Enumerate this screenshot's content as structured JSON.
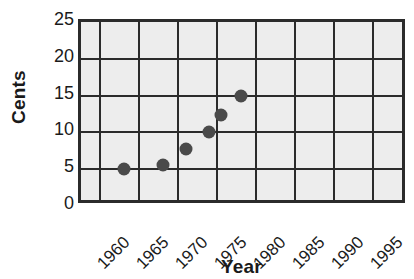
{
  "chart_data": {
    "type": "scatter",
    "title": "",
    "xlabel": "Year",
    "ylabel": "Cents",
    "xlim": [
      1957.5,
      1999.5
    ],
    "ylim": [
      0,
      25
    ],
    "xticks": [
      "1960",
      "1965",
      "1970",
      "1975",
      "1980",
      "1985",
      "1990",
      "1995"
    ],
    "xtick_values": [
      1960,
      1965,
      1970,
      1975,
      1980,
      1985,
      1990,
      1995
    ],
    "yticks": [
      "0",
      "5",
      "10",
      "15",
      "20",
      "25"
    ],
    "ytick_values": [
      0,
      5,
      10,
      15,
      20,
      25
    ],
    "grid": true,
    "legend": "none",
    "plot_background": "#ededed",
    "marker_color": "#4a4a4a",
    "axis_color": "#2b2b2b",
    "series": [
      {
        "name": "Postage rate",
        "x": [
          1963,
          1968,
          1971,
          1974,
          1975.5,
          1978
        ],
        "y": [
          5,
          5.6,
          7.8,
          10,
          12.3,
          15
        ]
      }
    ],
    "points": [
      {
        "x": 1963,
        "y": 5
      },
      {
        "x": 1968,
        "y": 5.6
      },
      {
        "x": 1971,
        "y": 7.8
      },
      {
        "x": 1974,
        "y": 10
      },
      {
        "x": 1975.5,
        "y": 12.3
      },
      {
        "x": 1978,
        "y": 15
      }
    ]
  }
}
